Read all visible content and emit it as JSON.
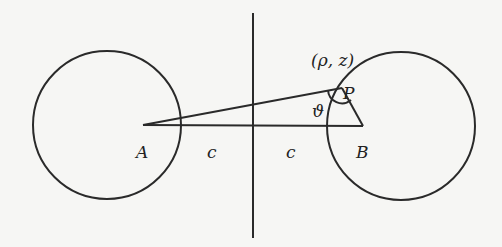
{
  "diagram": {
    "labels": {
      "A": "A",
      "B": "B",
      "c_left": "c",
      "c_right": "c",
      "P": "P",
      "coords": "(ρ, z)",
      "angle": "ϑ"
    },
    "colors": {
      "ink": "#2a2a2a",
      "background": "#f6f6f4"
    }
  }
}
